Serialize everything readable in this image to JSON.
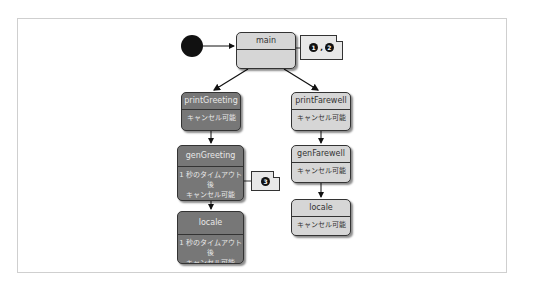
{
  "diagram": {
    "start": {
      "label": ""
    },
    "states": {
      "main": {
        "name": "main",
        "body": ""
      },
      "printGreeting": {
        "name": "printGreeting",
        "body": "キャンセル可能"
      },
      "printFarewell": {
        "name": "printFarewell",
        "body": "キャンセル可能"
      },
      "genGreeting": {
        "name": "genGreeting",
        "body_line1": "1 秒のタイムアウト後",
        "body_line2": "キャンセル可能"
      },
      "genFarewell": {
        "name": "genFarewell",
        "body": "キャンセル可能"
      },
      "localeLeft": {
        "name": "locale",
        "body_line1": "1 秒のタイムアウト後",
        "body_line2": "キャンセル可能"
      },
      "localeRight": {
        "name": "locale",
        "body": "キャンセル可能"
      }
    },
    "notes": {
      "main_note": {
        "badges": [
          "1",
          "2"
        ],
        "separator": ","
      },
      "genGreeting_note": {
        "badges": [
          "3"
        ]
      }
    },
    "colors": {
      "dark_state": "#777777",
      "light_state": "#d6d6d6",
      "outline": "#333333"
    }
  }
}
